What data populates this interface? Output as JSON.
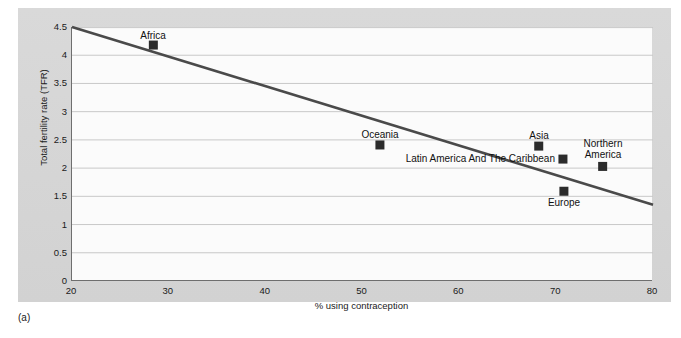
{
  "caption": "(a)",
  "chart_data": {
    "type": "scatter",
    "title": "",
    "xlabel": "% using contraception",
    "ylabel": "Total fertility rate (TFR)",
    "xlim": [
      20,
      80
    ],
    "ylim": [
      0,
      4.5
    ],
    "xticks": [
      "20",
      "30",
      "40",
      "50",
      "60",
      "70",
      "80"
    ],
    "yticks": [
      "0",
      "0.5",
      "1",
      "1.5",
      "2",
      "2.5",
      "3",
      "3.5",
      "4",
      "4.5"
    ],
    "grid": "horizontal",
    "legend": "none",
    "marker_color": "#2b2b2b",
    "trendline_color": "#4a4a4a",
    "gridline_color": "#c8c8c8",
    "points": [
      {
        "name": "Africa",
        "x": 28.4,
        "y": 4.18,
        "label_pos": "above-center"
      },
      {
        "name": "Oceania",
        "x": 51.8,
        "y": 2.41,
        "label_pos": "above-center"
      },
      {
        "name": "Asia",
        "x": 68.2,
        "y": 2.39,
        "label_pos": "above-center"
      },
      {
        "name": "Latin America And The Caribbean",
        "x": 70.7,
        "y": 2.16,
        "label_pos": "left"
      },
      {
        "name": "Europe",
        "x": 70.8,
        "y": 1.59,
        "label_pos": "below-center"
      },
      {
        "name": "Northern America",
        "x": 74.8,
        "y": 2.03,
        "label_pos": "above-center"
      }
    ],
    "trendline": {
      "x0": 20,
      "y0": 4.5,
      "x1": 80,
      "y1": 1.35
    }
  },
  "labels": {
    "africa": "Africa",
    "oceania": "Oceania",
    "asia": "Asia",
    "latin_america": "Latin America And The Caribbean",
    "europe": "Europe",
    "northern_america_line1": "Northern",
    "northern_america_line2": "America"
  },
  "yticks": {
    "t0": "0",
    "t1": "0.5",
    "t2": "1",
    "t3": "1.5",
    "t4": "2",
    "t5": "2.5",
    "t6": "3",
    "t7": "3.5",
    "t8": "4",
    "t9": "4.5"
  },
  "xticks": {
    "t0": "20",
    "t1": "30",
    "t2": "40",
    "t3": "50",
    "t4": "60",
    "t5": "70",
    "t6": "80"
  },
  "axis_titles": {
    "x": "% using contraception",
    "y": "Total fertility rate (TFR)"
  }
}
